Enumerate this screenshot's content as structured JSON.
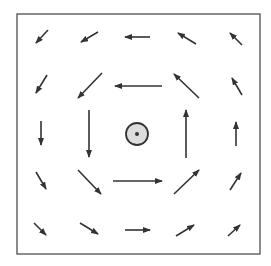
{
  "diagram": {
    "type": "vector-field",
    "colors": {
      "background": "#ffffff",
      "frame": "#666666",
      "arrow": "#333333",
      "center_fill": "#dddddd",
      "center_stroke": "#333333"
    },
    "frame": {
      "x": 17,
      "y": 14,
      "width": 243,
      "height": 240
    },
    "center": {
      "cx": 137,
      "cy": 134,
      "r": 11,
      "dot_r": 2
    },
    "arrows": [
      {
        "row": 1,
        "col": 1,
        "x1": 48,
        "y1": 30,
        "x2": 36,
        "y2": 43
      },
      {
        "row": 1,
        "col": 2,
        "x1": 98,
        "y1": 32,
        "x2": 81,
        "y2": 42
      },
      {
        "row": 1,
        "col": 3,
        "x1": 150,
        "y1": 37,
        "x2": 125,
        "y2": 37
      },
      {
        "row": 1,
        "col": 4,
        "x1": 196,
        "y1": 44,
        "x2": 178,
        "y2": 33
      },
      {
        "row": 1,
        "col": 5,
        "x1": 242,
        "y1": 45,
        "x2": 230,
        "y2": 33
      },
      {
        "row": 2,
        "col": 1,
        "x1": 47,
        "y1": 75,
        "x2": 36,
        "y2": 93
      },
      {
        "row": 2,
        "col": 2,
        "x1": 102,
        "y1": 73,
        "x2": 78,
        "y2": 98
      },
      {
        "row": 2,
        "col": 3,
        "x1": 162,
        "y1": 86,
        "x2": 115,
        "y2": 86
      },
      {
        "row": 2,
        "col": 4,
        "x1": 199,
        "y1": 98,
        "x2": 174,
        "y2": 74
      },
      {
        "row": 2,
        "col": 5,
        "x1": 242,
        "y1": 95,
        "x2": 232,
        "y2": 78
      },
      {
        "row": 3,
        "col": 1,
        "x1": 41,
        "y1": 121,
        "x2": 41,
        "y2": 145
      },
      {
        "row": 3,
        "col": 2,
        "x1": 89,
        "y1": 110,
        "x2": 89,
        "y2": 157
      },
      {
        "row": 3,
        "col": 4,
        "x1": 186,
        "y1": 158,
        "x2": 186,
        "y2": 110
      },
      {
        "row": 3,
        "col": 5,
        "x1": 236,
        "y1": 146,
        "x2": 236,
        "y2": 122
      },
      {
        "row": 4,
        "col": 1,
        "x1": 36,
        "y1": 172,
        "x2": 46,
        "y2": 189
      },
      {
        "row": 4,
        "col": 2,
        "x1": 78,
        "y1": 170,
        "x2": 101,
        "y2": 194
      },
      {
        "row": 4,
        "col": 3,
        "x1": 113,
        "y1": 181,
        "x2": 162,
        "y2": 181
      },
      {
        "row": 4,
        "col": 4,
        "x1": 174,
        "y1": 194,
        "x2": 199,
        "y2": 170
      },
      {
        "row": 4,
        "col": 5,
        "x1": 230,
        "y1": 190,
        "x2": 241,
        "y2": 173
      },
      {
        "row": 5,
        "col": 1,
        "x1": 34,
        "y1": 223,
        "x2": 46,
        "y2": 235
      },
      {
        "row": 5,
        "col": 2,
        "x1": 80,
        "y1": 223,
        "x2": 98,
        "y2": 234
      },
      {
        "row": 5,
        "col": 3,
        "x1": 125,
        "y1": 230,
        "x2": 150,
        "y2": 230
      },
      {
        "row": 5,
        "col": 4,
        "x1": 176,
        "y1": 236,
        "x2": 194,
        "y2": 225
      },
      {
        "row": 5,
        "col": 5,
        "x1": 228,
        "y1": 236,
        "x2": 240,
        "y2": 225
      }
    ]
  }
}
